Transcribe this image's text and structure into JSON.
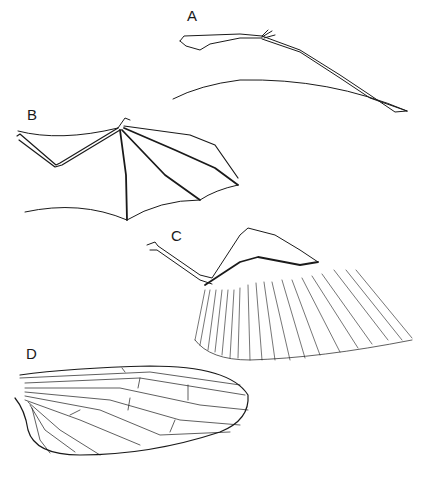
{
  "figure": {
    "panels": [
      {
        "id": "A",
        "label": "A",
        "subject": "pterosaur-wing"
      },
      {
        "id": "B",
        "label": "B",
        "subject": "bat-wing"
      },
      {
        "id": "C",
        "label": "C",
        "subject": "bird-wing"
      },
      {
        "id": "D",
        "label": "D",
        "subject": "insect-wing"
      }
    ],
    "colors": {
      "line": "#1a1a1a",
      "background": "#ffffff"
    }
  }
}
